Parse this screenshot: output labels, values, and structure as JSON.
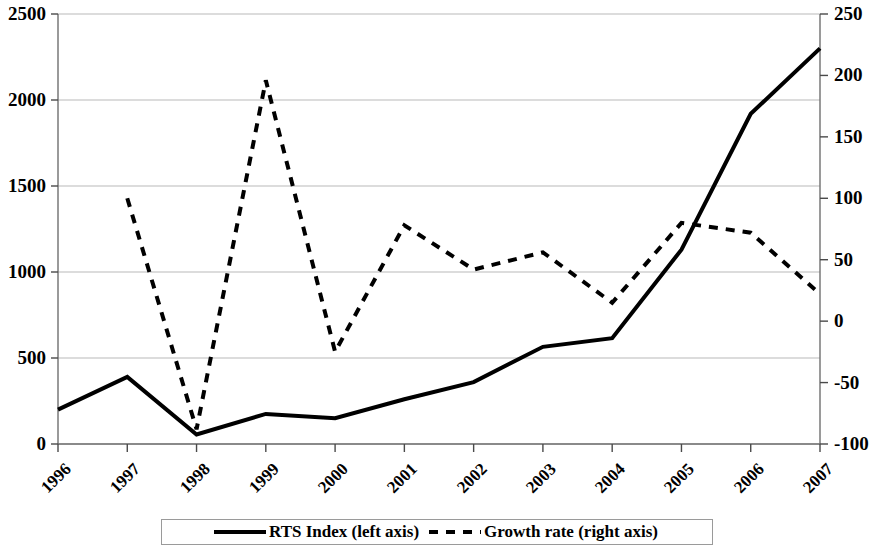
{
  "chart_data": {
    "type": "line",
    "title": "",
    "xlabel": "",
    "categories": [
      "1996",
      "1997",
      "1998",
      "1999",
      "2000",
      "2001",
      "2002",
      "2003",
      "2004",
      "2005",
      "2006",
      "2007"
    ],
    "grid": true,
    "legend_position": "bottom",
    "axes": {
      "left": {
        "label": "",
        "ylim": [
          0,
          2500
        ],
        "ticks": [
          0,
          500,
          1000,
          1500,
          2000,
          2500
        ],
        "tick_labels": [
          "0",
          "500",
          "1000",
          "1500",
          "2000",
          "2500"
        ]
      },
      "right": {
        "label": "",
        "ylim": [
          -100,
          250
        ],
        "ticks": [
          -100,
          -50,
          0,
          50,
          100,
          150,
          200,
          250
        ],
        "tick_labels": [
          "-100",
          "-50",
          "0",
          "50",
          "100",
          "150",
          "200",
          "250"
        ]
      }
    },
    "series": [
      {
        "name": "RTS Index (left axis)",
        "axis": "left",
        "style": "solid",
        "color": "#000000",
        "width": 4,
        "values": [
          200,
          390,
          55,
          175,
          150,
          260,
          360,
          565,
          615,
          1130,
          1920,
          2300
        ]
      },
      {
        "name": "Growth rate (right axis)",
        "axis": "right",
        "style": "dashed",
        "color": "#000000",
        "width": 4,
        "values": [
          null,
          100,
          -88,
          196,
          -25,
          78,
          42,
          56,
          15,
          80,
          72,
          22
        ]
      }
    ]
  },
  "legend": {
    "entries": [
      {
        "label": "RTS Index (left axis)",
        "style": "solid"
      },
      {
        "label": "Growth rate (right axis)",
        "style": "dashed"
      }
    ]
  }
}
